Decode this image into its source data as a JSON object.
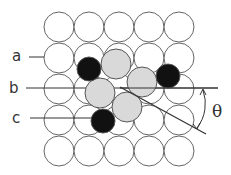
{
  "figure": {
    "type": "atomic-lattice-diagram",
    "grid": {
      "rows": 5,
      "cols": 5,
      "origin_x": 59,
      "origin_y": 27,
      "spacing_x": 30,
      "spacing_y": 31,
      "radius": 15,
      "stroke": "#666666",
      "fill": "#ffffff"
    },
    "gray_atoms": [
      {
        "cx": 116,
        "cy": 64,
        "r": 15
      },
      {
        "cx": 142,
        "cy": 82,
        "r": 15
      },
      {
        "cx": 100,
        "cy": 93,
        "r": 15
      },
      {
        "cx": 127,
        "cy": 107,
        "r": 15
      }
    ],
    "black_atoms": [
      {
        "cx": 89,
        "cy": 69,
        "r": 12
      },
      {
        "cx": 168,
        "cy": 76,
        "r": 12
      },
      {
        "cx": 103,
        "cy": 121,
        "r": 12
      }
    ],
    "colors": {
      "gray_fill": "#d9d9d9",
      "black_fill": "#111111",
      "line": "#333333"
    },
    "labels": {
      "a": "a",
      "b": "b",
      "c": "c",
      "angle": "θ"
    },
    "lines": {
      "a": {
        "x1": 29,
        "y1": 57,
        "x2": 44,
        "y2": 57
      },
      "b": {
        "x1": 26,
        "y1": 88,
        "x2": 218,
        "y2": 88
      },
      "c": {
        "x1": 30,
        "y1": 118,
        "x2": 92,
        "y2": 118
      },
      "diagonal": {
        "x1": 120,
        "y1": 87,
        "x2": 206,
        "y2": 134
      }
    }
  }
}
